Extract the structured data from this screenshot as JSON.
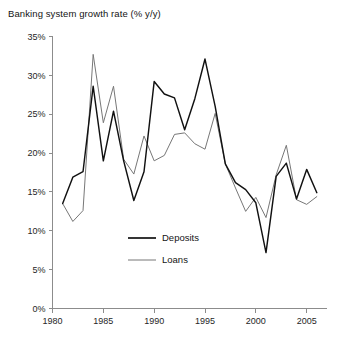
{
  "chart_data": {
    "type": "line",
    "title": "Banking system growth rate (% y/y)",
    "xlabel": "",
    "ylabel": "",
    "xlim": [
      1980,
      2007
    ],
    "ylim": [
      0,
      35
    ],
    "grid": false,
    "legend_position": "inside-center",
    "y_ticks": [
      "0%",
      "5%",
      "10%",
      "15%",
      "20%",
      "25%",
      "30%",
      "35%"
    ],
    "y_tick_values": [
      0,
      5,
      10,
      15,
      20,
      25,
      30,
      35
    ],
    "x_ticks": [
      "1980",
      "1985",
      "1990",
      "1995",
      "2000",
      "2005"
    ],
    "x_tick_values": [
      1980,
      1985,
      1990,
      1995,
      2000,
      2005
    ],
    "x": [
      1981,
      1982,
      1983,
      1984,
      1985,
      1986,
      1987,
      1988,
      1989,
      1990,
      1991,
      1992,
      1993,
      1994,
      1995,
      1996,
      1997,
      1998,
      1999,
      2000,
      2001,
      2002,
      2003,
      2004,
      2005,
      2006
    ],
    "series": [
      {
        "name": "Deposits",
        "color": "#111111",
        "values": [
          13.5,
          16.9,
          17.6,
          28.6,
          19.0,
          25.4,
          19.0,
          13.9,
          17.6,
          29.2,
          27.6,
          27.1,
          23.0,
          27.0,
          32.1,
          26.0,
          18.6,
          16.2,
          15.3,
          13.6,
          7.2,
          17.0,
          18.7,
          14.1,
          17.9,
          14.9
        ]
      },
      {
        "name": "Loans",
        "color": "#777777",
        "values": [
          13.5,
          11.2,
          12.6,
          32.7,
          23.9,
          28.6,
          19.2,
          17.3,
          22.2,
          19.0,
          19.7,
          22.4,
          22.6,
          21.2,
          20.5,
          25.1,
          18.6,
          15.5,
          12.5,
          14.3,
          11.7,
          17.2,
          21.0,
          14.0,
          13.4,
          14.4
        ]
      }
    ]
  },
  "legend": {
    "items": [
      {
        "label": "Deposits"
      },
      {
        "label": "Loans"
      }
    ]
  }
}
